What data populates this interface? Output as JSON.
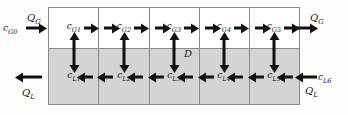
{
  "diagram": {
    "colors": {
      "background": "#fdfdfc",
      "gas_row_fill": "#ffffff",
      "liquid_row_fill": "#d4d4d4",
      "grid_line": "#8a8a8a",
      "arrow": "#111111",
      "text": "#1a1a1a"
    },
    "gas_row": {
      "name": "gas-phase-row",
      "cells": [
        {
          "symbol": "c",
          "subscript": "G1"
        },
        {
          "symbol": "c",
          "subscript": "G2"
        },
        {
          "symbol": "c",
          "subscript": "G3"
        },
        {
          "symbol": "c",
          "subscript": "G4"
        },
        {
          "symbol": "c",
          "subscript": "G5"
        }
      ],
      "flow_direction": "right"
    },
    "liquid_row": {
      "name": "liquid-phase-row",
      "cells": [
        {
          "symbol": "c",
          "subscript": "L1"
        },
        {
          "symbol": "c",
          "subscript": "L2"
        },
        {
          "symbol": "c",
          "subscript": "L3"
        },
        {
          "symbol": "c",
          "subscript": "L4"
        },
        {
          "symbol": "c",
          "subscript": "L5"
        }
      ],
      "flow_direction": "left"
    },
    "boundaries": {
      "gas_inlet": {
        "symbol": "c",
        "subscript": "G0"
      },
      "gas_inlet_flow": {
        "symbol": "Q",
        "subscript": "G"
      },
      "gas_outlet_flow": {
        "symbol": "Q",
        "subscript": "G"
      },
      "liquid_inlet": {
        "symbol": "c",
        "subscript": "L6"
      },
      "liquid_inlet_flow": {
        "symbol": "Q",
        "subscript": "L"
      },
      "liquid_outlet_flow": {
        "symbol": "Q",
        "subscript": "L"
      }
    },
    "interphase": {
      "label": "D",
      "description": "interphase diffusive exchange"
    }
  }
}
